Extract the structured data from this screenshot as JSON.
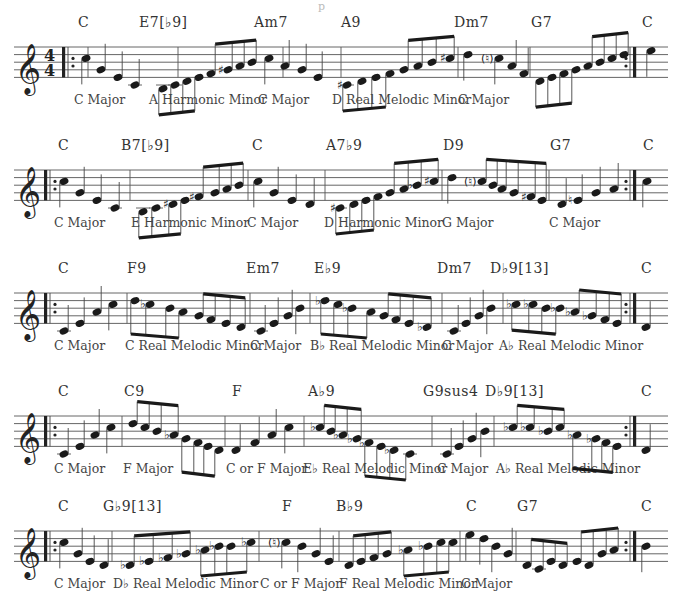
{
  "page": {
    "title_fragment": "p",
    "time_signature": "4/4",
    "clef": "treble"
  },
  "rows": [
    {
      "top": 10,
      "start_repeat": true,
      "show_time_sig": true,
      "chords": [
        {
          "label": "C",
          "x": 78
        },
        {
          "label": "E7[♭9]",
          "x": 139
        },
        {
          "label": "Am7",
          "x": 254
        },
        {
          "label": "A9",
          "x": 341
        },
        {
          "label": "Dm7",
          "x": 454
        },
        {
          "label": "G7",
          "x": 531
        },
        {
          "label": "C",
          "x": 642
        }
      ],
      "scales": [
        {
          "label": "C Major",
          "x": 74
        },
        {
          "label": "A Harmonic Minor",
          "x": 149
        },
        {
          "label": "C Major",
          "x": 258
        },
        {
          "label": "D Real Melodic Minor",
          "x": 332
        },
        {
          "label": "C Major",
          "x": 458
        }
      ],
      "bars": [
        88,
        178,
        283,
        341,
        458,
        530,
        634
      ],
      "notes": [
        {
          "x": 86,
          "p": 5
        },
        {
          "x": 101,
          "p": 2
        },
        {
          "x": 118,
          "p": 0
        },
        {
          "x": 135,
          "p": -2
        },
        {
          "x": 163,
          "p": -3
        },
        {
          "x": 175,
          "p": -2
        },
        {
          "x": 187,
          "p": -1
        },
        {
          "x": 199,
          "p": 0
        },
        {
          "x": 211,
          "p": 1
        },
        {
          "x": 228,
          "p": 2,
          "acc": "♯"
        },
        {
          "x": 240,
          "p": 3
        },
        {
          "x": 252,
          "p": 4
        },
        {
          "x": 269,
          "p": 5
        },
        {
          "x": 285,
          "p": 3
        },
        {
          "x": 302,
          "p": 2
        },
        {
          "x": 318,
          "p": 0
        },
        {
          "x": 347,
          "p": -2,
          "acc": "♯"
        },
        {
          "x": 362,
          "p": -1
        },
        {
          "x": 376,
          "p": 0
        },
        {
          "x": 390,
          "p": 1
        },
        {
          "x": 404,
          "p": 2
        },
        {
          "x": 418,
          "p": 3
        },
        {
          "x": 432,
          "p": 4
        },
        {
          "x": 450,
          "p": 5,
          "acc": "♯"
        },
        {
          "x": 468,
          "p": 6
        },
        {
          "x": 499,
          "p": 5,
          "acc": "(♮)"
        },
        {
          "x": 512,
          "p": 3
        },
        {
          "x": 524,
          "p": 1
        },
        {
          "x": 540,
          "p": -1
        },
        {
          "x": 552,
          "p": 0
        },
        {
          "x": 564,
          "p": 1
        },
        {
          "x": 576,
          "p": 2
        },
        {
          "x": 588,
          "p": 3
        },
        {
          "x": 600,
          "p": 4
        },
        {
          "x": 612,
          "p": 5
        },
        {
          "x": 624,
          "p": 6
        },
        {
          "x": 651,
          "p": 7
        }
      ],
      "beams": [
        [
          4,
          7,
          -1
        ],
        [
          8,
          11,
          1
        ],
        [
          16,
          19,
          -1
        ],
        [
          20,
          23,
          1
        ],
        [
          28,
          31,
          -1
        ],
        [
          32,
          35,
          1
        ]
      ],
      "end_repeat_x": 630
    },
    {
      "top": 133,
      "start_repeat": true,
      "show_time_sig": false,
      "chords": [
        {
          "label": "C",
          "x": 58
        },
        {
          "label": "B7[♭9]",
          "x": 121
        },
        {
          "label": "C",
          "x": 252
        },
        {
          "label": "A7♭9",
          "x": 326
        },
        {
          "label": "D9",
          "x": 443
        },
        {
          "label": "G7",
          "x": 550
        },
        {
          "label": "C",
          "x": 643
        }
      ],
      "scales": [
        {
          "label": "C Major",
          "x": 54
        },
        {
          "label": "E Harmonic Minor",
          "x": 131
        },
        {
          "label": "C Major",
          "x": 247
        },
        {
          "label": "D Harmonic Minor",
          "x": 324
        },
        {
          "label": "G Major",
          "x": 442
        },
        {
          "label": "C Major",
          "x": 549
        }
      ],
      "bars": [
        130,
        248,
        325,
        442,
        549,
        634
      ],
      "notes": [
        {
          "x": 64,
          "p": 5
        },
        {
          "x": 80,
          "p": 2
        },
        {
          "x": 97,
          "p": 0
        },
        {
          "x": 115,
          "p": -2
        },
        {
          "x": 143,
          "p": -3
        },
        {
          "x": 156,
          "p": -2
        },
        {
          "x": 173,
          "p": -1,
          "acc": "♯"
        },
        {
          "x": 185,
          "p": 0
        },
        {
          "x": 199,
          "p": 1,
          "acc": "♯"
        },
        {
          "x": 215,
          "p": 2
        },
        {
          "x": 227,
          "p": 3
        },
        {
          "x": 239,
          "p": 4
        },
        {
          "x": 258,
          "p": 5
        },
        {
          "x": 274,
          "p": 2
        },
        {
          "x": 292,
          "p": 0
        },
        {
          "x": 310,
          "p": -1
        },
        {
          "x": 340,
          "p": -2,
          "acc": "♯"
        },
        {
          "x": 354,
          "p": -1
        },
        {
          "x": 366,
          "p": 0
        },
        {
          "x": 378,
          "p": 1
        },
        {
          "x": 390,
          "p": 2
        },
        {
          "x": 404,
          "p": 3
        },
        {
          "x": 417,
          "p": 4,
          "acc": "♭"
        },
        {
          "x": 434,
          "p": 5,
          "acc": "♯"
        },
        {
          "x": 452,
          "p": 6
        },
        {
          "x": 482,
          "p": 5,
          "acc": "(♮)"
        },
        {
          "x": 493,
          "p": 4
        },
        {
          "x": 502,
          "p": 3
        },
        {
          "x": 514,
          "p": 2
        },
        {
          "x": 531,
          "p": 1,
          "acc": "♯"
        },
        {
          "x": 542,
          "p": 0
        },
        {
          "x": 562,
          "p": -1
        },
        {
          "x": 578,
          "p": 0,
          "acc": "♮"
        },
        {
          "x": 596,
          "p": 2
        },
        {
          "x": 614,
          "p": 3
        },
        {
          "x": 647,
          "p": 5
        }
      ],
      "beams": [
        [
          4,
          7,
          -1
        ],
        [
          8,
          11,
          1
        ],
        [
          16,
          19,
          -1
        ],
        [
          20,
          23,
          1
        ],
        [
          25,
          30,
          1
        ]
      ],
      "end_repeat_x": 630
    },
    {
      "top": 256,
      "start_repeat": true,
      "show_time_sig": false,
      "chords": [
        {
          "label": "C",
          "x": 58
        },
        {
          "label": "F9",
          "x": 127
        },
        {
          "label": "Em7",
          "x": 246
        },
        {
          "label": "E♭9",
          "x": 314
        },
        {
          "label": "Dm7",
          "x": 437
        },
        {
          "label": "D♭9[13]",
          "x": 490
        },
        {
          "label": "C",
          "x": 641
        }
      ],
      "scales": [
        {
          "label": "C Major",
          "x": 54
        },
        {
          "label": "C Real Melodic Minor",
          "x": 125
        },
        {
          "label": "C Major",
          "x": 250
        },
        {
          "label": "B♭ Real Melodic Minor",
          "x": 310
        },
        {
          "label": "C Major",
          "x": 442
        },
        {
          "label": "A♭ Real Melodic Minor",
          "x": 499
        }
      ],
      "bars": [
        127,
        250,
        310,
        442,
        503,
        634
      ],
      "notes": [
        {
          "x": 64,
          "p": -2
        },
        {
          "x": 80,
          "p": 0
        },
        {
          "x": 97,
          "p": 3
        },
        {
          "x": 113,
          "p": 5
        },
        {
          "x": 135,
          "p": 6
        },
        {
          "x": 150,
          "p": 5,
          "acc": "♭"
        },
        {
          "x": 170,
          "p": 4
        },
        {
          "x": 183,
          "p": 3
        },
        {
          "x": 199,
          "p": 2
        },
        {
          "x": 211,
          "p": 1
        },
        {
          "x": 226,
          "p": 0
        },
        {
          "x": 241,
          "p": -1
        },
        {
          "x": 261,
          "p": -2
        },
        {
          "x": 274,
          "p": 0
        },
        {
          "x": 288,
          "p": 2
        },
        {
          "x": 300,
          "p": 4
        },
        {
          "x": 325,
          "p": 6,
          "acc": "♭"
        },
        {
          "x": 338,
          "p": 5
        },
        {
          "x": 352,
          "p": 4,
          "acc": "♭"
        },
        {
          "x": 371,
          "p": 3
        },
        {
          "x": 384,
          "p": 2
        },
        {
          "x": 396,
          "p": 1
        },
        {
          "x": 409,
          "p": 0
        },
        {
          "x": 427,
          "p": -1,
          "acc": "♭"
        },
        {
          "x": 454,
          "p": -2
        },
        {
          "x": 466,
          "p": 0
        },
        {
          "x": 479,
          "p": 2
        },
        {
          "x": 491,
          "p": 4
        },
        {
          "x": 516,
          "p": 5,
          "acc": "♭"
        },
        {
          "x": 533,
          "p": 5,
          "acc": "♭"
        },
        {
          "x": 546,
          "p": 4
        },
        {
          "x": 560,
          "p": 4,
          "acc": "♭"
        },
        {
          "x": 575,
          "p": 3,
          "acc": "♭"
        },
        {
          "x": 592,
          "p": 2,
          "acc": "♭"
        },
        {
          "x": 605,
          "p": 1
        },
        {
          "x": 617,
          "p": 0
        },
        {
          "x": 646,
          "p": -1
        }
      ],
      "beams": [
        [
          4,
          7,
          -1
        ],
        [
          8,
          11,
          1
        ],
        [
          16,
          19,
          -1
        ],
        [
          20,
          23,
          1
        ],
        [
          28,
          31,
          -1
        ],
        [
          32,
          35,
          1
        ]
      ],
      "end_repeat_x": 630
    },
    {
      "top": 379,
      "start_repeat": true,
      "show_time_sig": false,
      "chords": [
        {
          "label": "C",
          "x": 58
        },
        {
          "label": "C9",
          "x": 124
        },
        {
          "label": "F",
          "x": 232
        },
        {
          "label": "A♭9",
          "x": 308
        },
        {
          "label": "G9sus4",
          "x": 423
        },
        {
          "label": "D♭9[13]",
          "x": 485
        },
        {
          "label": "C",
          "x": 641
        }
      ],
      "scales": [
        {
          "label": "C Major",
          "x": 54
        },
        {
          "label": "F Major",
          "x": 123
        },
        {
          "label": "C or F Major",
          "x": 226
        },
        {
          "label": "E♭ Real Melodic Minor",
          "x": 303
        },
        {
          "label": "C Major",
          "x": 437
        },
        {
          "label": "A♭ Real Melodic Minor",
          "x": 496
        }
      ],
      "bars": [
        122,
        225,
        304,
        432,
        494,
        634
      ],
      "notes": [
        {
          "x": 64,
          "p": -2
        },
        {
          "x": 80,
          "p": 0
        },
        {
          "x": 95,
          "p": 3
        },
        {
          "x": 111,
          "p": 5
        },
        {
          "x": 133,
          "p": 6
        },
        {
          "x": 145,
          "p": 5
        },
        {
          "x": 157,
          "p": 4
        },
        {
          "x": 174,
          "p": 3,
          "acc": "♭"
        },
        {
          "x": 186,
          "p": 2
        },
        {
          "x": 198,
          "p": 1
        },
        {
          "x": 208,
          "p": 0
        },
        {
          "x": 219,
          "p": -1
        },
        {
          "x": 236,
          "p": -1
        },
        {
          "x": 255,
          "p": 1
        },
        {
          "x": 272,
          "p": 3
        },
        {
          "x": 289,
          "p": 5
        },
        {
          "x": 320,
          "p": 5,
          "acc": "♭"
        },
        {
          "x": 331,
          "p": 4
        },
        {
          "x": 343,
          "p": 3,
          "acc": "♭"
        },
        {
          "x": 357,
          "p": 2,
          "acc": "♭"
        },
        {
          "x": 369,
          "p": 1,
          "acc": "♭"
        },
        {
          "x": 381,
          "p": 0
        },
        {
          "x": 394,
          "p": -1,
          "acc": "♭"
        },
        {
          "x": 410,
          "p": -2
        },
        {
          "x": 447,
          "p": -2
        },
        {
          "x": 459,
          "p": 0
        },
        {
          "x": 472,
          "p": 2
        },
        {
          "x": 485,
          "p": 4
        },
        {
          "x": 513,
          "p": 5,
          "acc": "♭"
        },
        {
          "x": 530,
          "p": 5,
          "acc": "♭"
        },
        {
          "x": 548,
          "p": 4,
          "acc": "♭"
        },
        {
          "x": 560,
          "p": 5
        },
        {
          "x": 577,
          "p": 3,
          "acc": "♭"
        },
        {
          "x": 596,
          "p": 2,
          "acc": "♭"
        },
        {
          "x": 606,
          "p": 1
        },
        {
          "x": 617,
          "p": 0
        },
        {
          "x": 646,
          "p": -1
        }
      ],
      "beams": [
        [
          4,
          7,
          1
        ],
        [
          8,
          11,
          -1
        ],
        [
          16,
          19,
          1
        ],
        [
          20,
          23,
          -1
        ],
        [
          28,
          31,
          1
        ],
        [
          32,
          35,
          -1
        ]
      ],
      "end_repeat_x": 630
    },
    {
      "top": 494,
      "start_repeat": true,
      "show_time_sig": false,
      "chords": [
        {
          "label": "C",
          "x": 58
        },
        {
          "label": "G♭9[13]",
          "x": 103
        },
        {
          "label": "F",
          "x": 282
        },
        {
          "label": "B♭9",
          "x": 336
        },
        {
          "label": "C",
          "x": 466
        },
        {
          "label": "G7",
          "x": 517
        },
        {
          "label": "C",
          "x": 641
        }
      ],
      "scales": [
        {
          "label": "C Major",
          "x": 54
        },
        {
          "label": "D♭ Real Melodic Minor",
          "x": 113
        },
        {
          "label": "C or F Major",
          "x": 260
        },
        {
          "label": "F Real Melodic Minor",
          "x": 339
        },
        {
          "label": "C Major",
          "x": 461
        }
      ],
      "bars": [
        112,
        259,
        339,
        460,
        516,
        634
      ],
      "notes": [
        {
          "x": 64,
          "p": 5
        },
        {
          "x": 78,
          "p": 2
        },
        {
          "x": 90,
          "p": 0
        },
        {
          "x": 104,
          "p": -1
        },
        {
          "x": 130,
          "p": -1,
          "acc": "♭"
        },
        {
          "x": 149,
          "p": 0,
          "acc": "♭"
        },
        {
          "x": 168,
          "p": 1,
          "acc": "♭"
        },
        {
          "x": 186,
          "p": 2,
          "acc": "♭"
        },
        {
          "x": 205,
          "p": 3,
          "acc": "♭"
        },
        {
          "x": 219,
          "p": 4,
          "acc": "♭"
        },
        {
          "x": 231,
          "p": 4
        },
        {
          "x": 251,
          "p": 5,
          "acc": "♭"
        },
        {
          "x": 286,
          "p": 5,
          "acc": "(♮)"
        },
        {
          "x": 302,
          "p": 4
        },
        {
          "x": 316,
          "p": 2
        },
        {
          "x": 329,
          "p": 0
        },
        {
          "x": 349,
          "p": -1
        },
        {
          "x": 361,
          "p": 0
        },
        {
          "x": 374,
          "p": 1
        },
        {
          "x": 387,
          "p": 2
        },
        {
          "x": 408,
          "p": 3,
          "acc": "♭"
        },
        {
          "x": 428,
          "p": 4,
          "acc": "♭"
        },
        {
          "x": 441,
          "p": 5
        },
        {
          "x": 453,
          "p": 5
        },
        {
          "x": 470,
          "p": 7
        },
        {
          "x": 484,
          "p": 6
        },
        {
          "x": 496,
          "p": 4
        },
        {
          "x": 508,
          "p": 2
        },
        {
          "x": 527,
          "p": -1
        },
        {
          "x": 539,
          "p": -2
        },
        {
          "x": 551,
          "p": 0
        },
        {
          "x": 563,
          "p": -1
        },
        {
          "x": 577,
          "p": 0
        },
        {
          "x": 589,
          "p": -1
        },
        {
          "x": 602,
          "p": 2
        },
        {
          "x": 614,
          "p": 3
        },
        {
          "x": 646,
          "p": 4
        }
      ],
      "beams": [
        [
          4,
          7,
          1
        ],
        [
          8,
          11,
          -1
        ],
        [
          16,
          19,
          1
        ],
        [
          20,
          23,
          -1
        ],
        [
          28,
          31,
          1
        ],
        [
          32,
          35,
          1
        ]
      ],
      "end_repeat_x": 630
    }
  ]
}
